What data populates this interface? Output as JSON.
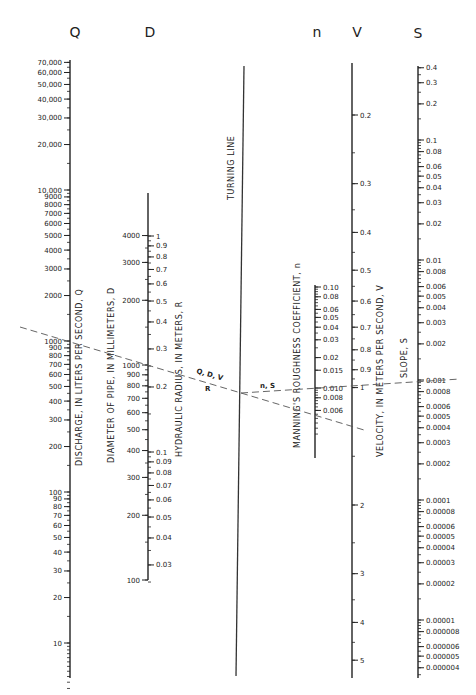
{
  "chart_data": {
    "type": "nomogram",
    "title": "",
    "column_headers": [
      "Q",
      "D",
      "n",
      "V",
      "S"
    ],
    "turning_line_label": "TURNING LINE",
    "scales": [
      {
        "key": "Q",
        "axis_label": "DISCHARGE, IN LITERS PER SECOND, Q",
        "scale": "log",
        "range": [
          5,
          70000
        ],
        "ticks": [
          "70,000",
          "60,000",
          "50,000",
          "40,000",
          "30,000",
          "20,000",
          "10,000",
          "9000",
          "8000",
          "7000",
          "6000",
          "5000",
          "4000",
          "3000",
          "2000",
          "1000",
          "900",
          "800",
          "700",
          "600",
          "500",
          "400",
          "300",
          "200",
          "100",
          "90",
          "80",
          "70",
          "60",
          "50",
          "40",
          "30",
          "20",
          "10"
        ],
        "values": [
          70000,
          60000,
          50000,
          40000,
          30000,
          20000,
          10000,
          9000,
          8000,
          7000,
          6000,
          5000,
          4000,
          3000,
          2000,
          1000,
          900,
          800,
          700,
          600,
          500,
          400,
          300,
          200,
          100,
          90,
          80,
          70,
          60,
          50,
          40,
          30,
          20,
          10
        ]
      },
      {
        "key": "D",
        "axis_label": "DIAMETER OF PIPE, IN MILLIMETERS, D",
        "scale": "log",
        "range": [
          100,
          4000
        ],
        "ticks": [
          "4000",
          "3000",
          "2000",
          "1000",
          "900",
          "800",
          "700",
          "600",
          "500",
          "400",
          "300",
          "200",
          "100"
        ],
        "values": [
          4000,
          3000,
          2000,
          1000,
          900,
          800,
          700,
          600,
          500,
          400,
          300,
          200,
          100
        ]
      },
      {
        "key": "R",
        "axis_label": "HYDRAULIC RADIUS, IN METERS, R",
        "scale": "log",
        "range": [
          0.025,
          1
        ],
        "ticks": [
          "1",
          "0.9",
          "0.8",
          "0.7",
          "0.6",
          "0.5",
          "0.4",
          "0.3",
          "0.2",
          "0.1",
          "0.09",
          "0.08",
          "0.07",
          "0.06",
          "0.05",
          "0.04",
          "0.03"
        ],
        "values": [
          1,
          0.9,
          0.8,
          0.7,
          0.6,
          0.5,
          0.4,
          0.3,
          0.2,
          0.1,
          0.09,
          0.08,
          0.07,
          0.06,
          0.05,
          0.04,
          0.03
        ]
      },
      {
        "key": "n",
        "axis_label": "MANNING'S ROUGHNESS COEFFICIENT, n",
        "scale": "log",
        "range": [
          0.0025,
          0.1
        ],
        "ticks": [
          "0.10",
          "0.08",
          "0.06",
          "0.05",
          "0.04",
          "0.03",
          "0.02",
          "0.015",
          "0.010",
          "0.008",
          "0.006"
        ],
        "values": [
          0.1,
          0.08,
          0.06,
          0.05,
          0.04,
          0.03,
          0.02,
          0.015,
          0.01,
          0.008,
          0.006
        ]
      },
      {
        "key": "V",
        "axis_label": "VELOCITY, IN METERS PER SECOND, V",
        "scale": "log",
        "range": [
          0.15,
          5.5
        ],
        "ticks": [
          "0.2",
          "0.3",
          "0.4",
          "0.5",
          "0.6",
          "0.7",
          "0.8",
          "0.9",
          "1",
          "2",
          "3",
          "4",
          "5"
        ],
        "values": [
          0.2,
          0.3,
          0.4,
          0.5,
          0.6,
          0.7,
          0.8,
          0.9,
          1,
          2,
          3,
          4,
          5
        ]
      },
      {
        "key": "S",
        "axis_label": "SLOPE, S",
        "scale": "log",
        "range": [
          3.5e-06,
          0.4
        ],
        "ticks": [
          "0.4",
          "0.3",
          "0.2",
          "0.1",
          "0.08",
          "0.06",
          "0.05",
          "0.04",
          "0.03",
          "0.02",
          "0.01",
          "0.008",
          "0.006",
          "0.005",
          "0.004",
          "0.003",
          "0.002",
          "0.001",
          "0.0008",
          "0.0006",
          "0.0005",
          "0.0004",
          "0.0003",
          "0.0002",
          "0.0001",
          "0.00008",
          "0.00006",
          "0.00005",
          "0.00004",
          "0.00003",
          "0.00002",
          "0.00001",
          "0.000008",
          "0.000006",
          "0.000005",
          "0.000004"
        ],
        "values": [
          0.4,
          0.3,
          0.2,
          0.1,
          0.08,
          0.06,
          0.05,
          0.04,
          0.03,
          0.02,
          0.01,
          0.008,
          0.006,
          0.005,
          0.004,
          0.003,
          0.002,
          0.001,
          0.0008,
          0.0006,
          0.0005,
          0.0004,
          0.0003,
          0.0002,
          0.0001,
          8e-05,
          6e-05,
          5e-05,
          4e-05,
          3e-05,
          2e-05,
          1e-05,
          8e-06,
          6e-06,
          5e-06,
          4e-06
        ]
      }
    ],
    "example_lines": [
      {
        "label": "Q, D, V / R",
        "from": "Q≈1100 (beyond left)",
        "through": [
          "D≈1000",
          "R≈0.25"
        ],
        "to": "turning line pivot, continuing past n≈0.005 to V≈1.3"
      },
      {
        "label": "n, S",
        "from": "turning line pivot",
        "through": [
          "n=0.010"
        ],
        "to": "S=0.001"
      }
    ],
    "line_labels": {
      "qdv": "Q, D, V",
      "r": "R",
      "ns": "n, S"
    }
  }
}
